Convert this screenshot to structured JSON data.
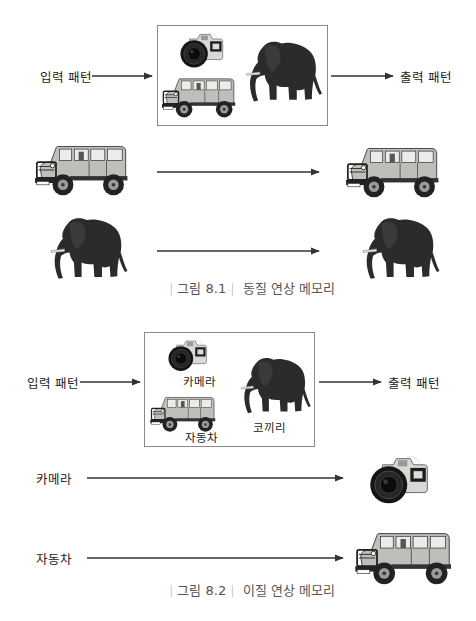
{
  "figure1": {
    "input_label": "입력 패턴",
    "output_label": "출력 패턴",
    "caption_prefix": "그림 8.1",
    "caption_title": "동질 연상 메모리",
    "box_items": [
      "camera",
      "jeep",
      "elephant"
    ],
    "pairs": [
      {
        "input": "jeep",
        "output": "jeep"
      },
      {
        "input": "elephant",
        "output": "elephant"
      }
    ]
  },
  "figure2": {
    "input_label": "입력 패턴",
    "output_label": "출력 패턴",
    "caption_prefix": "그림 8.2",
    "caption_title": "이질 연상 메모리",
    "box_items": [
      {
        "image": "camera",
        "label": "카메라"
      },
      {
        "image": "jeep",
        "label": "자동차"
      },
      {
        "image": "elephant",
        "label": "코끼리"
      }
    ],
    "pairs": [
      {
        "input": "카메라",
        "output": "camera"
      },
      {
        "input": "자동차",
        "output": "jeep"
      }
    ]
  },
  "colors": {
    "arrow": "#333333",
    "box_border": "#8a8a8a",
    "caption_text": "#555555",
    "elephant": "#2a2a2a",
    "jeep_body": "#b9bcb6"
  }
}
